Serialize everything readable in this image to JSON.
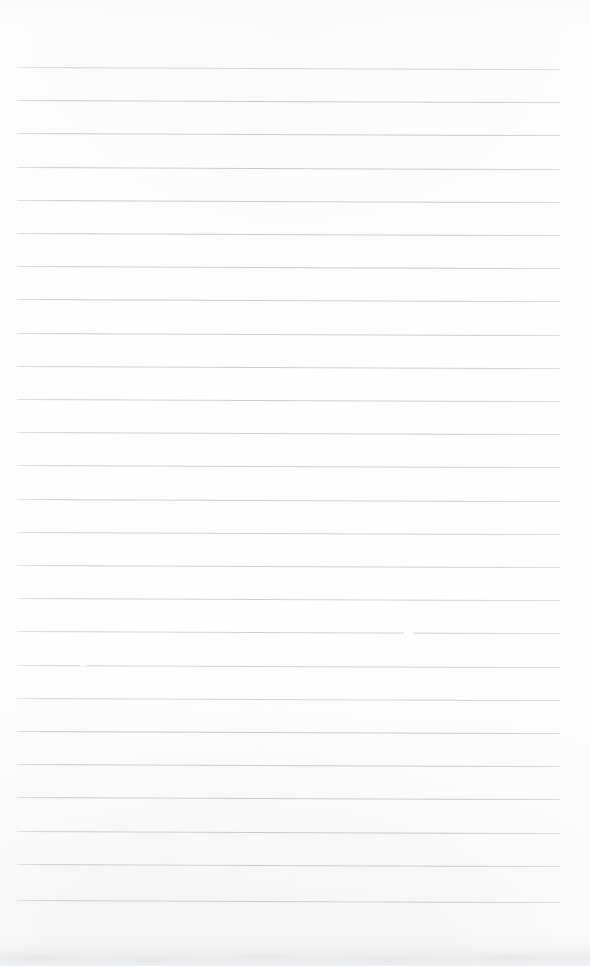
{
  "document": {
    "kind": "scanned-lined-notebook-page",
    "title": "Blank Lined Notebook Page",
    "page_width": 590,
    "page_height": 966,
    "has_text_content": false,
    "handwriting_present": false,
    "printed_text_present": false
  },
  "colors": {
    "paper_background": "#fefefe",
    "rule_line": "#c2c6ca",
    "scan_smudge": "#e4e6e8"
  },
  "ruling": {
    "style": "horizontal-ruled",
    "line_count": 26,
    "line_spacing_px": 33.2,
    "first_line_y": 67,
    "last_line_y": 900,
    "line_left_x": 17,
    "line_right_x": 560,
    "line_thickness_px": 1,
    "skew_degrees": 0.22,
    "has_vertical_margin_rule": false,
    "has_header_rule": false,
    "lines_y": [
      67,
      100.2,
      133.4,
      166.6,
      199.8,
      233,
      266.2,
      299.4,
      332.6,
      365.8,
      399,
      432.2,
      465.4,
      498.6,
      531.8,
      565,
      598.2,
      631.4,
      664.6,
      697.8,
      731,
      764.2,
      797.4,
      830.6,
      863.8,
      900
    ]
  },
  "artifacts": {
    "line_gaps": [
      {
        "line_index": 17,
        "x": 404,
        "width": 9
      },
      {
        "line_index": 18,
        "x": 80,
        "width": 7
      }
    ],
    "bottom_edge_smudge": {
      "present": true,
      "y": 932,
      "height": 34,
      "description": "faint grey scanner shadow along bottom edge"
    },
    "top_edge_tone": {
      "present": true,
      "y": 0,
      "height": 26
    }
  }
}
